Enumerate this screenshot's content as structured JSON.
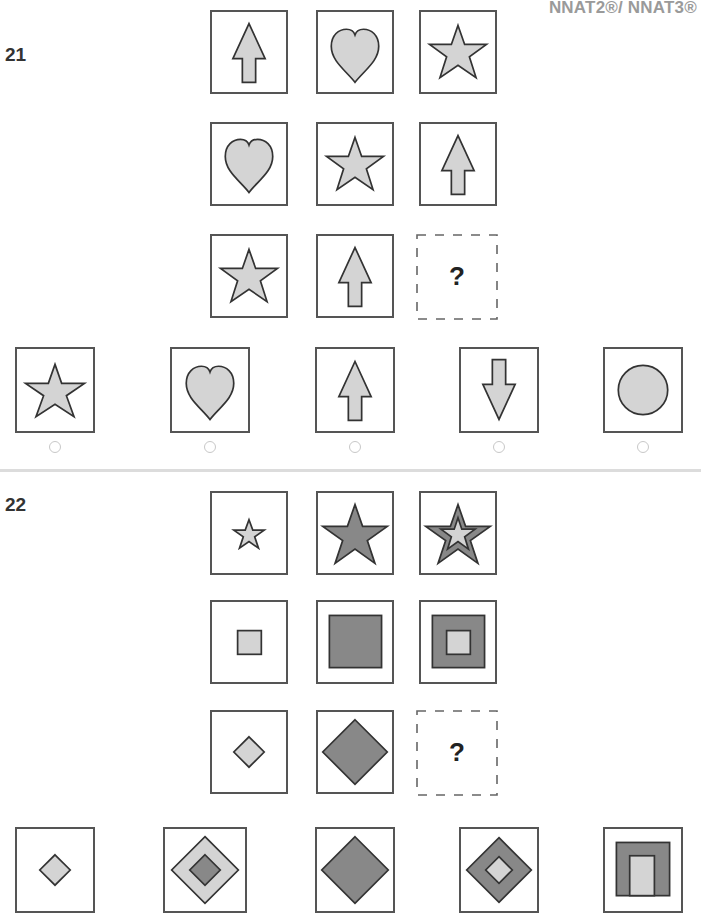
{
  "header": {
    "label": "NNAT2®/ NNAT3®"
  },
  "colors": {
    "light_fill": "#d4d4d4",
    "dark_fill": "#888888",
    "stroke": "#333333",
    "box_border": "#555555",
    "radio_border": "#c8c8c8",
    "divider": "#dcdcdc",
    "header_text": "#9a9a9a"
  },
  "questions": [
    {
      "number": "21",
      "matrix": [
        [
          "arrow-up",
          "heart",
          "star"
        ],
        [
          "heart",
          "star",
          "arrow-up"
        ],
        [
          "star",
          "arrow-up",
          "missing"
        ]
      ],
      "missing_label": "?",
      "options": [
        "star",
        "heart",
        "arrow-up",
        "arrow-down",
        "circle"
      ]
    },
    {
      "number": "22",
      "matrix": [
        [
          "small-light-star",
          "large-dark-star",
          "dark-star-with-light-star-inside"
        ],
        [
          "small-light-square",
          "large-dark-square",
          "dark-square-with-light-square-inside"
        ],
        [
          "small-light-diamond",
          "large-dark-diamond",
          "missing"
        ]
      ],
      "missing_label": "?",
      "options": [
        "small-light-diamond",
        "light-diamond-with-dark-diamond-inside",
        "large-dark-diamond",
        "dark-diamond-with-light-diamond-inside",
        "dark-square-with-light-rectangle-inside"
      ]
    }
  ]
}
